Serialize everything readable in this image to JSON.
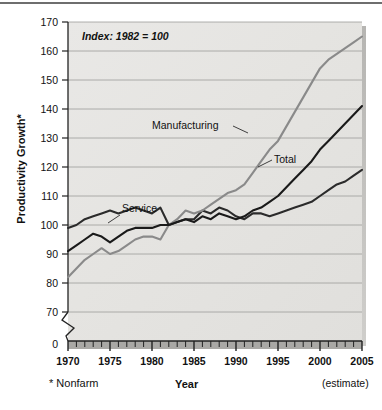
{
  "figure": {
    "name": "productivity-growth-line-chart",
    "annotation_note": "Index: 1982 = 100",
    "footnote": "* Nonfarm",
    "estimate_note": "(estimate)"
  },
  "chart_data": {
    "type": "line",
    "title": "",
    "subtitle": "",
    "xlabel": "Year",
    "ylabel": "Productivity Growth*",
    "annotations": [
      "Index: 1982 = 100",
      "* Nonfarm",
      "(estimate)"
    ],
    "legend_position": "inline-labels",
    "grid": true,
    "axis_break": true,
    "xlim": [
      1970,
      2005
    ],
    "ylim": [
      65,
      170
    ],
    "yticks": [
      70,
      80,
      90,
      100,
      110,
      120,
      130,
      140,
      150,
      160,
      170
    ],
    "ytick_labels": [
      "0",
      "70",
      "80",
      "90",
      "100",
      "110",
      "120",
      "130",
      "140",
      "150",
      "160",
      "170"
    ],
    "xticks": [
      1970,
      1975,
      1980,
      1985,
      1990,
      1995,
      2000,
      2005
    ],
    "xtick_labels": [
      "1970",
      "1975",
      "1980",
      "1985",
      "1990",
      "1995",
      "2000",
      "2005"
    ],
    "x": [
      1970,
      1971,
      1972,
      1973,
      1974,
      1975,
      1976,
      1977,
      1978,
      1979,
      1980,
      1981,
      1982,
      1983,
      1984,
      1985,
      1986,
      1987,
      1988,
      1989,
      1990,
      1991,
      1992,
      1993,
      1994,
      1995,
      1996,
      1997,
      1998,
      1999,
      2000,
      2001,
      2002,
      2003,
      2004,
      2005
    ],
    "series": [
      {
        "name": "Service",
        "color": "#2b2b2b",
        "label_x": 1977,
        "label_y": 110,
        "values": [
          99,
          100,
          102,
          103,
          104,
          105,
          104,
          105,
          106,
          105,
          104,
          106,
          100,
          101,
          102,
          102,
          105,
          104,
          106,
          105,
          103,
          102,
          104,
          104,
          103,
          104,
          105,
          106,
          107,
          108,
          110,
          112,
          114,
          115,
          117,
          119
        ]
      },
      {
        "name": "Manufacturing",
        "color": "#8a8a8a",
        "label_x": 1989,
        "label_y": 128,
        "values": [
          82,
          85,
          88,
          90,
          92,
          90,
          91,
          93,
          95,
          96,
          96,
          95,
          100,
          102,
          105,
          104,
          105,
          107,
          109,
          111,
          112,
          114,
          118,
          122,
          126,
          129,
          134,
          139,
          144,
          149,
          154,
          157,
          159,
          161,
          163,
          165
        ]
      },
      {
        "name": "Total",
        "color": "#1a1a1a",
        "label_x": 1996,
        "label_y": 122,
        "values": [
          91,
          93,
          95,
          97,
          96,
          94,
          96,
          98,
          99,
          99,
          99,
          100,
          100,
          101,
          102,
          101,
          103,
          102,
          104,
          103,
          102,
          103,
          105,
          106,
          108,
          110,
          113,
          116,
          119,
          122,
          126,
          129,
          132,
          135,
          138,
          141
        ]
      }
    ]
  }
}
